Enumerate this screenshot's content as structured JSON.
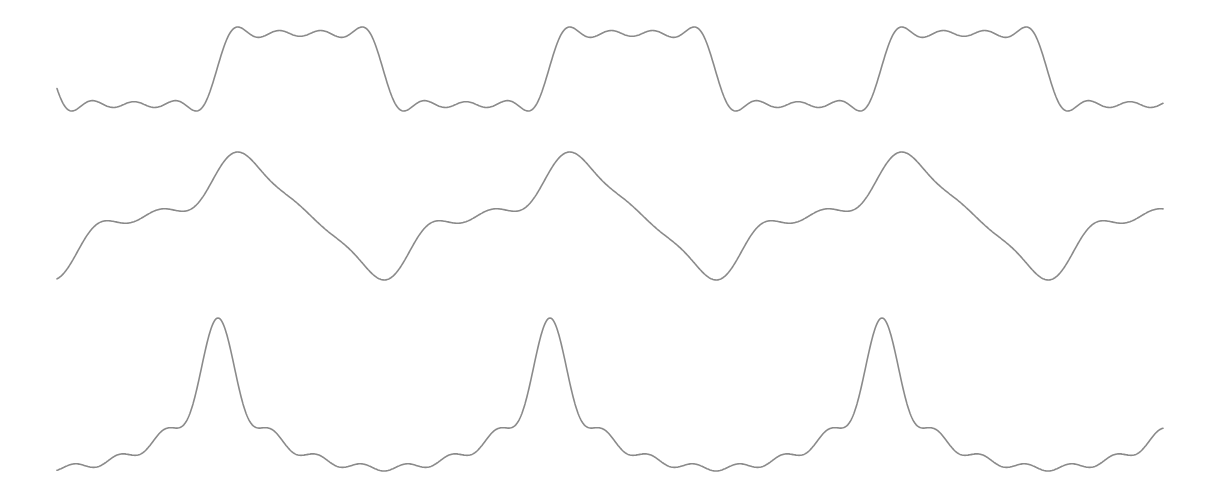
{
  "chart_data": {
    "type": "line",
    "title": "",
    "xlabel": "",
    "ylabel": "",
    "grid": false,
    "legend": null,
    "x_range_px": [
      57,
      1163
    ],
    "period_px": 332,
    "stroke_color": "#8a8a8a",
    "background": "#ffffff",
    "series": [
      {
        "name": "square-wave-fourier-approximation",
        "description": "Square wave, partial Fourier sum (odd harmonics 1,3,5,7)",
        "phase_center_px": 300,
        "y_center_px": 69,
        "amplitude_px": 38,
        "harmonics": [
          {
            "n": 1,
            "cos": 1.0,
            "sin": 0
          },
          {
            "n": 3,
            "cos": -0.3333,
            "sin": 0
          },
          {
            "n": 5,
            "cos": 0.2,
            "sin": 0
          },
          {
            "n": 7,
            "cos": -0.1429,
            "sin": 0
          }
        ],
        "high_level_y_px": 32,
        "low_level_y_px": 106
      },
      {
        "name": "stepped-wave-fourier-approximation",
        "description": "Staircase-like periodic wave with peak and trough",
        "phase_center_px": 228,
        "y_center_px": 215,
        "amplitude_px": 40,
        "harmonics": [
          {
            "n": 1,
            "cos": 1.0,
            "sin": 0
          },
          {
            "n": 2,
            "cos": 0.0,
            "sin": 0.35
          },
          {
            "n": 3,
            "cos": 0.22,
            "sin": 0
          },
          {
            "n": 4,
            "cos": 0.0,
            "sin": 0.12
          },
          {
            "n": 5,
            "cos": 0.12,
            "sin": 0
          }
        ],
        "peak": {
          "x_px": 228,
          "y_px": 152
        },
        "trough": {
          "x_px": 388,
          "y_px": 280
        }
      },
      {
        "name": "peaked-wave-fourier-approximation",
        "description": "Sharply peaked periodic wave (cosine harmonics 1..7, 1/n weights)",
        "phase_center_px": 218,
        "y_center_px": 398,
        "amplitude_px": 28,
        "harmonics": [
          {
            "n": 1,
            "cos": 1.0,
            "sin": 0
          },
          {
            "n": 2,
            "cos": 0.5,
            "sin": 0
          },
          {
            "n": 3,
            "cos": 0.3333,
            "sin": 0
          },
          {
            "n": 4,
            "cos": 0.25,
            "sin": 0
          },
          {
            "n": 5,
            "cos": 0.2,
            "sin": 0
          },
          {
            "n": 6,
            "cos": 0.1667,
            "sin": 0
          },
          {
            "n": 7,
            "cos": 0.1429,
            "sin": 0
          }
        ],
        "peak": {
          "x_px": 218,
          "y_px": 318
        },
        "trough": {
          "x_px": 384,
          "y_px": 471
        }
      }
    ]
  }
}
